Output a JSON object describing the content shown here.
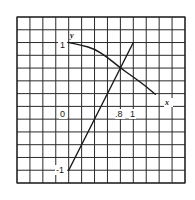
{
  "chart_data": {
    "type": "line",
    "title": "",
    "xlabel": "x",
    "ylabel": "y",
    "grid": true,
    "grid_cells": {
      "columns": 13,
      "rows": 13
    },
    "units_per_cell": 0.2,
    "xlim": [
      -0.8,
      1.8
    ],
    "ylim": [
      -1.2,
      1.4
    ],
    "tick_labels": {
      "origin": "0",
      "x": [
        ".8",
        "1"
      ],
      "y": [
        "1",
        "-1"
      ]
    },
    "series": [
      {
        "name": "curve",
        "description": "decreasing curve starting at (0, 1)",
        "x": [
          0,
          0.2,
          0.4,
          0.6,
          0.8,
          1.0,
          1.2,
          1.34
        ],
        "y": [
          1.0,
          0.96,
          0.9,
          0.77,
          0.6,
          0.46,
          0.31,
          0.19
        ]
      },
      {
        "name": "line",
        "description": "straight line y = 2x - 1",
        "x": [
          0,
          1
        ],
        "y": [
          -1,
          1
        ]
      }
    ],
    "annotations": [
      {
        "text": "intersection",
        "x": 0.8,
        "y": 0.6
      }
    ]
  },
  "labels": {
    "y_axis_name": "y",
    "x_axis_name": "x",
    "y_one": "1",
    "y_minus_one": "-1",
    "origin": "0",
    "x_point_eight": ".8",
    "x_one": "1"
  }
}
